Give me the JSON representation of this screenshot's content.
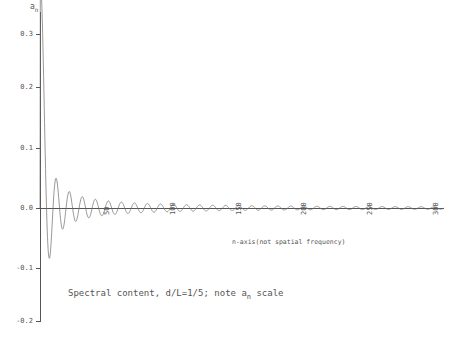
{
  "chart_data": {
    "type": "line",
    "xlabel": "n-axis (not spatial frequency)",
    "ylabel": "a_n",
    "ylim": [
      -0.3,
      0.3
    ],
    "xlim": [
      0,
      310
    ],
    "yticks": [
      "0.3",
      "0.2",
      "0.1",
      "0.0",
      "-0.1",
      "-0.2",
      "-0.3"
    ],
    "ytick_values": [
      0.3,
      0.2,
      0.1,
      0.0,
      -0.1,
      -0.2,
      -0.3
    ],
    "xticks": [
      "50",
      "100",
      "150",
      "200",
      "250",
      "300"
    ],
    "xtick_values": [
      50,
      100,
      150,
      200,
      250,
      300
    ],
    "grid": false,
    "legend": "none",
    "series": [
      {
        "name": "a_n",
        "description": "Fourier coefficients a_n = (2/(n*pi))*sin(n*pi*d/L) for d/L=1/5, decaying oscillatory envelope",
        "envelope_peak": 0.205,
        "peak_n": 2,
        "zero_crossings_period": 5
      }
    ]
  },
  "labels": {
    "axis_y_title": "a",
    "axis_y_sub": "n",
    "x_note": "n-axis(not spatial frequency)",
    "caption_pre": "Spectral content, d/L=1/5; note a",
    "caption_sub": "n",
    "caption_post": " scale"
  }
}
